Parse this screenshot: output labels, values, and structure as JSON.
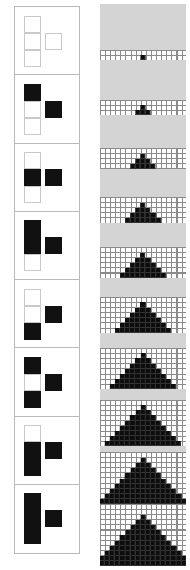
{
  "figure": {
    "background_color": "#ffffff",
    "fill_color": "#111111",
    "band_color": "#d4d4d4",
    "grid_line_color": "#8a8a8a",
    "cell_px": 5.1
  },
  "left_column": {
    "name": "tetromino-key-column",
    "border_color": "#b9b9b9",
    "layout_note": "each cell holds a 2-column block: a vertical stack of 3 squares on the left and 1 square at the middle-right",
    "cells": [
      {
        "index": 1,
        "label": "cell-1",
        "left_stack": [
          0,
          0,
          0
        ],
        "right_square": 0
      },
      {
        "index": 2,
        "label": "cell-2",
        "left_stack": [
          1,
          0,
          0
        ],
        "right_square": 1
      },
      {
        "index": 3,
        "label": "cell-3",
        "left_stack": [
          0,
          1,
          0
        ],
        "right_square": 1
      },
      {
        "index": 4,
        "label": "cell-4",
        "left_stack": [
          1,
          1,
          0
        ],
        "right_square": 1
      },
      {
        "index": 5,
        "label": "cell-5",
        "left_stack": [
          0,
          0,
          1
        ],
        "right_square": 1
      },
      {
        "index": 6,
        "label": "cell-6",
        "left_stack": [
          1,
          0,
          1
        ],
        "right_square": 1
      },
      {
        "index": 7,
        "label": "cell-7",
        "left_stack": [
          0,
          1,
          1
        ],
        "right_square": 1
      },
      {
        "index": 8,
        "label": "cell-8",
        "left_stack": [
          1,
          1,
          1
        ],
        "right_square": 1
      }
    ]
  },
  "right_column": {
    "name": "pyramid-sequence-column",
    "layout_note": "ten stacked panels; each panel shows a gridded strip with a stepped black pyramid resting on the strip baseline, above a plain gray band",
    "rows": [
      {
        "index": 1,
        "label": "pyramid-1",
        "levels": 1,
        "base_width": 1,
        "row_top": 4,
        "row_height": 56,
        "strip_height": 10,
        "grid_cols": 17
      },
      {
        "index": 2,
        "label": "pyramid-2",
        "levels": 2,
        "base_width": 3,
        "row_top": 60,
        "row_height": 55,
        "strip_height": 15,
        "grid_cols": 17
      },
      {
        "index": 3,
        "label": "pyramid-3",
        "levels": 3,
        "base_width": 5,
        "row_top": 115,
        "row_height": 54,
        "strip_height": 21,
        "grid_cols": 17
      },
      {
        "index": 4,
        "label": "pyramid-4",
        "levels": 4,
        "base_width": 7,
        "row_top": 169,
        "row_height": 54,
        "strip_height": 26,
        "grid_cols": 17
      },
      {
        "index": 5,
        "label": "pyramid-5",
        "levels": 5,
        "base_width": 9,
        "row_top": 223,
        "row_height": 55,
        "strip_height": 31,
        "grid_cols": 17
      },
      {
        "index": 6,
        "label": "pyramid-6",
        "levels": 6,
        "base_width": 11,
        "row_top": 278,
        "row_height": 55,
        "strip_height": 36,
        "grid_cols": 17
      },
      {
        "index": 7,
        "label": "pyramid-7",
        "levels": 7,
        "base_width": 13,
        "row_top": 333,
        "row_height": 56,
        "strip_height": 41,
        "grid_cols": 17
      },
      {
        "index": 8,
        "label": "pyramid-8",
        "levels": 8,
        "base_width": 15,
        "row_top": 389,
        "row_height": 57,
        "strip_height": 46,
        "grid_cols": 17
      },
      {
        "index": 9,
        "label": "pyramid-9",
        "levels": 9,
        "base_width": 17,
        "row_top": 446,
        "row_height": 58,
        "strip_height": 52,
        "grid_cols": 17
      },
      {
        "index": 10,
        "label": "pyramid-10",
        "levels": 10,
        "base_width": 19,
        "row_top": 504,
        "row_height": 62,
        "strip_height": 62,
        "grid_cols": 17
      }
    ]
  }
}
